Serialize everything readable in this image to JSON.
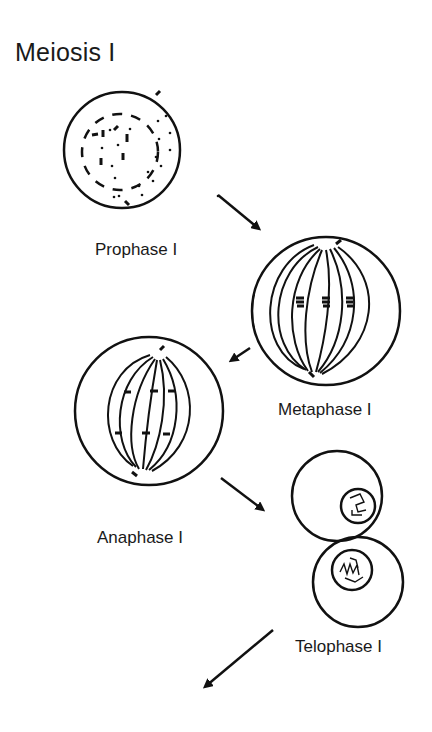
{
  "title": "Meiosis I",
  "stages": [
    {
      "id": "prophase",
      "label": "Prophase I"
    },
    {
      "id": "metaphase",
      "label": "Metaphase I"
    },
    {
      "id": "anaphase",
      "label": "Anaphase I"
    },
    {
      "id": "telophase",
      "label": "Telophase I"
    }
  ],
  "colors": {
    "stroke": "#111111",
    "background": "#ffffff"
  }
}
